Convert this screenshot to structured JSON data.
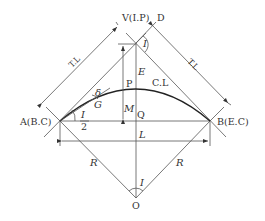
{
  "diagram": {
    "type": "circular-curve-geometry",
    "points": {
      "V": "V(I.P)",
      "D": "D",
      "A": "A(B.C)",
      "B": "B(E.C)",
      "O": "O",
      "P": "P",
      "Q": "Q"
    },
    "labels": {
      "tangent_length_left": "T.L",
      "tangent_length_right": "T.L",
      "curve_length": "C.L",
      "intersection_angle_top": "I",
      "intersection_angle_center": "I",
      "external_secant": "E",
      "middle_ordinate": "M",
      "long_chord": "L",
      "radius_left": "R",
      "radius_right": "R",
      "deflection_angle": "δ",
      "chord": "G",
      "half_angle_num": "I",
      "half_angle_den": "2"
    },
    "colors": {
      "line": "#555555",
      "curve": "#222222",
      "text": "#333333",
      "background": "#ffffff"
    }
  }
}
